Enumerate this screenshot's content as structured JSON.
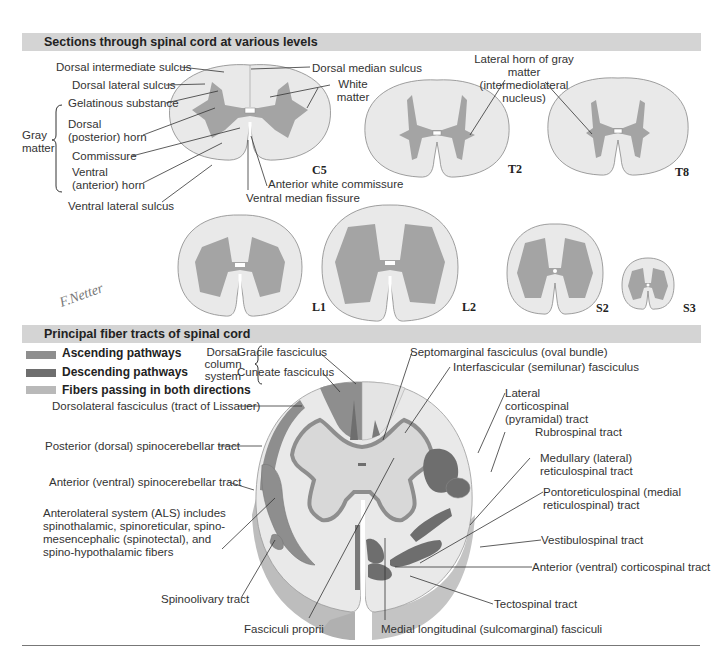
{
  "colors": {
    "banner": "#d4d4d4",
    "white_matter": "#e9e9e9",
    "gray_matter": "#a4a4a4",
    "ascending": "#8e8e8e",
    "descending": "#6e6e6e",
    "both_directions": "#b9b9b9",
    "cord_side": "#bdbdbd"
  },
  "section1": {
    "title": "Sections through spinal cord at various levels",
    "labels": {
      "dorsal_intermediate_sulcus": "Dorsal intermediate sulcus",
      "dorsal_median_sulcus": "Dorsal median sulcus",
      "dorsal_lateral_sulcus": "Dorsal lateral sulcus",
      "white_matter": "White matter",
      "gelatinous_substance": "Gelatinous substance",
      "gray_matter": "Gray matter",
      "dorsal_horn": "Dorsal (posterior) horn",
      "commissure": "Commissure",
      "ventral_horn": "Ventral (anterior) horn",
      "ventral_lateral_sulcus": "Ventral lateral sulcus",
      "anterior_white_commissure": "Anterior white commissure",
      "ventral_median_fissure": "Ventral median fissure",
      "lateral_horn": "Lateral horn of gray matter (intermediolateral nucleus)"
    },
    "levels": [
      "C5",
      "T2",
      "T8",
      "L1",
      "L2",
      "S2",
      "S3"
    ],
    "signature": "F. Netter M.D."
  },
  "section2": {
    "title": "Principal fiber tracts of spinal cord",
    "legend": [
      {
        "label": "Ascending pathways",
        "color": "#8e8e8e"
      },
      {
        "label": "Descending pathways",
        "color": "#6e6e6e"
      },
      {
        "label": "Fibers passing in both directions",
        "color": "#b9b9b9"
      }
    ],
    "dorsal_column_system": "Dorsal column system",
    "labels_left": [
      "Gracile fasciculus",
      "Cuneate fasciculus",
      "Dorsolateral fasciculus (tract of Lissauer)",
      "Posterior (dorsal) spinocerebellar tract",
      "Anterior (ventral) spinocerebellar tract",
      "Anterolateral system (ALS) includes spinothalamic, spinoreticular, spino-mesencephalic (spinotectal), and spino-hypothalamic fibers",
      "Spinoolivary tract",
      "Fasciculi proprii"
    ],
    "labels_right": [
      "Septomarginal fasciculus (oval bundle)",
      "Interfascicular (semilunar) fasciculus",
      "Lateral corticospinal (pyramidal) tract",
      "Rubrospinal tract",
      "Medullary (lateral) reticulospinal tract",
      "Pontoreticulospinal (medial reticulospinal) tract",
      "Vestibulospinal tract",
      "Anterior (ventral) corticospinal tract",
      "Tectospinal tract",
      "Medial longitudinal (sulcomarginal) fasciculi"
    ]
  }
}
